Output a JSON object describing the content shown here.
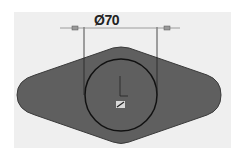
{
  "diagram": {
    "type": "cad-sketch",
    "dimension": {
      "label": "Ø70",
      "symbol": "diameter",
      "value": 70
    },
    "shape": {
      "kind": "rounded-diamond",
      "fill": "#5f5f5f",
      "stroke": "#333333"
    },
    "circle": {
      "stroke": "#111111"
    },
    "colors": {
      "background": "#efefef",
      "page": "#ffffff"
    }
  }
}
